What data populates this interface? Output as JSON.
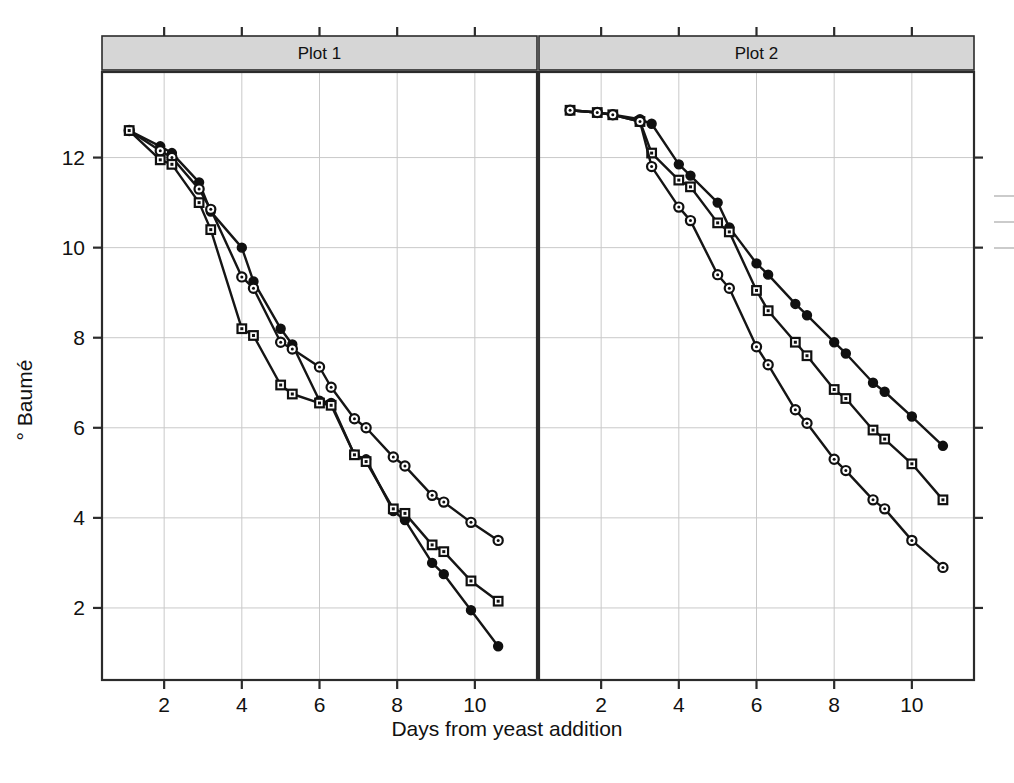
{
  "figure": {
    "background": "#ffffff",
    "ink_color": "#151515",
    "grid_color": "#c9c9c9",
    "strip_fill": "#d6d6d6"
  },
  "chart_data": {
    "type": "line",
    "title": "",
    "subtitle": "",
    "xlabel": "Days from yeast addition",
    "ylabel": "° Baumé",
    "xlim": [
      0.4,
      11.6
    ],
    "ylim": [
      0.4,
      13.9
    ],
    "xticks": [
      2,
      4,
      6,
      8,
      10
    ],
    "xtick_labels": [
      "2",
      "4",
      "6",
      "8",
      "10"
    ],
    "yticks": [
      2,
      4,
      6,
      8,
      10,
      12
    ],
    "ytick_labels": [
      "2",
      "4",
      "6",
      "8",
      "10",
      "12"
    ],
    "grid": true,
    "grid_axes": "both",
    "legend_position": "right-outside-cropped",
    "legend_entries": [
      "",
      "",
      ""
    ],
    "panel_layout": "1x2",
    "panels": [
      {
        "strip_label": "Plot 1",
        "series": [
          {
            "name": "series-a",
            "marker": "filled-circle",
            "x": [
              1.1,
              1.9,
              2.2,
              2.9,
              3.2,
              4.0,
              4.3,
              5.0,
              5.3,
              6.0,
              6.3,
              6.9,
              7.2,
              7.9,
              8.2,
              8.9,
              9.2,
              9.9,
              10.6
            ],
            "y": [
              12.6,
              12.25,
              12.1,
              11.45,
              10.8,
              10.0,
              9.25,
              8.2,
              7.85,
              6.6,
              6.55,
              5.4,
              5.3,
              4.15,
              3.95,
              3.0,
              2.75,
              1.95,
              1.15
            ]
          },
          {
            "name": "series-b",
            "marker": "open-circle",
            "x": [
              1.1,
              1.9,
              2.2,
              2.9,
              3.2,
              4.0,
              4.3,
              5.0,
              5.3,
              6.0,
              6.3,
              6.9,
              7.2,
              7.9,
              8.2,
              8.9,
              9.2,
              9.9,
              10.6
            ],
            "y": [
              12.6,
              12.15,
              12.0,
              11.3,
              10.85,
              9.35,
              9.1,
              7.9,
              7.75,
              7.35,
              6.9,
              6.2,
              6.0,
              5.35,
              5.15,
              4.5,
              4.35,
              3.9,
              3.5
            ]
          },
          {
            "name": "series-c",
            "marker": "square",
            "x": [
              1.1,
              1.9,
              2.2,
              2.9,
              3.2,
              4.0,
              4.3,
              5.0,
              5.3,
              6.0,
              6.3,
              6.9,
              7.2,
              7.9,
              8.2,
              8.9,
              9.2,
              9.9,
              10.6
            ],
            "y": [
              12.6,
              11.95,
              11.85,
              11.0,
              10.4,
              8.2,
              8.05,
              6.95,
              6.75,
              6.55,
              6.5,
              5.4,
              5.25,
              4.2,
              4.1,
              3.4,
              3.25,
              2.6,
              2.15
            ]
          }
        ]
      },
      {
        "strip_label": "Plot 2",
        "series": [
          {
            "name": "series-a",
            "marker": "filled-circle",
            "x": [
              1.2,
              1.9,
              2.3,
              3.0,
              3.3,
              4.0,
              4.3,
              5.0,
              5.3,
              6.0,
              6.3,
              7.0,
              7.3,
              8.0,
              8.3,
              9.0,
              9.3,
              10.0,
              10.8
            ],
            "y": [
              13.05,
              13.0,
              12.95,
              12.85,
              12.75,
              11.85,
              11.6,
              11.0,
              10.45,
              9.65,
              9.4,
              8.75,
              8.5,
              7.9,
              7.65,
              7.0,
              6.8,
              6.25,
              5.6
            ]
          },
          {
            "name": "series-b",
            "marker": "square",
            "x": [
              1.2,
              1.9,
              2.3,
              3.0,
              3.3,
              4.0,
              4.3,
              5.0,
              5.3,
              6.0,
              6.3,
              7.0,
              7.3,
              8.0,
              8.3,
              9.0,
              9.3,
              10.0,
              10.8
            ],
            "y": [
              13.05,
              13.0,
              12.95,
              12.8,
              12.1,
              11.5,
              11.35,
              10.55,
              10.35,
              9.05,
              8.6,
              7.9,
              7.6,
              6.85,
              6.65,
              5.95,
              5.75,
              5.2,
              4.4
            ]
          },
          {
            "name": "series-c",
            "marker": "open-circle",
            "x": [
              1.2,
              1.9,
              2.3,
              3.0,
              3.3,
              4.0,
              4.3,
              5.0,
              5.3,
              6.0,
              6.3,
              7.0,
              7.3,
              8.0,
              8.3,
              9.0,
              9.3,
              10.0,
              10.8
            ],
            "y": [
              13.05,
              13.0,
              12.95,
              12.8,
              11.8,
              10.9,
              10.6,
              9.4,
              9.1,
              7.8,
              7.4,
              6.4,
              6.1,
              5.3,
              5.05,
              4.4,
              4.2,
              3.5,
              2.9
            ]
          }
        ]
      }
    ]
  }
}
